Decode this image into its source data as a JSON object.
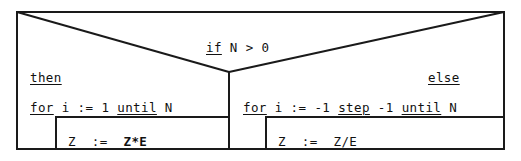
{
  "diagram": {
    "kind": "nassi-shneiderman-structogram",
    "condition": {
      "keyword": "if",
      "expression": "N > 0"
    },
    "branches": {
      "then_label": "then",
      "else_label": "else"
    },
    "then_branch": {
      "loop": {
        "kw_for": "for",
        "var": "i",
        "assign": ":=",
        "from": "1",
        "kw_until": "until",
        "to": "N",
        "full_text": "for i := 1 until N"
      },
      "body": {
        "target": "Z",
        "assign": ":=",
        "expression": "Z*E",
        "full_text": "Z := Z*E"
      }
    },
    "else_branch": {
      "loop": {
        "kw_for": "for",
        "var": "i",
        "assign": ":=",
        "from": "-1",
        "kw_step": "step",
        "step": "-1",
        "kw_until": "until",
        "to": "N",
        "full_text": "for i := -1 step -1 until N"
      },
      "body": {
        "target": "Z",
        "assign": ":=",
        "expression": "Z/E",
        "full_text": "Z := Z/E"
      }
    },
    "colors": {
      "stroke": "#1a1a1a",
      "text": "#111111",
      "background": "#ffffff"
    }
  }
}
